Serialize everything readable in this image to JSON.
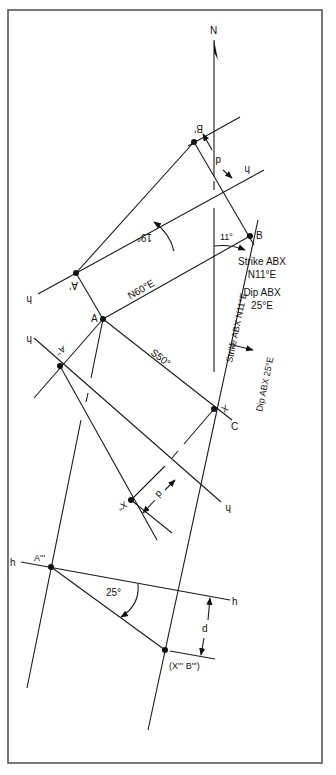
{
  "figure": {
    "north_label": "N",
    "points": {
      "A": "A",
      "B": "B",
      "A_prime": "A'",
      "B_prime": "B'",
      "A_dblprime": "A''",
      "X": "X",
      "X_dblprime": "X''",
      "C": "C",
      "A_tripleprime": "A'''",
      "X_B_tripleprime": "(X''' B''')"
    },
    "fold_lines": {
      "h_upper_left": "h",
      "h_upper_right": "h",
      "h_middle_left": "h",
      "h_middle_right": "h",
      "h_lower_left": "h",
      "h_lower_right": "h"
    },
    "measurements": {
      "d_upper": "d",
      "d_middle": "d",
      "d_lower": "d",
      "angle_19": "19°",
      "angle_11": "11°",
      "angle_25": "25°",
      "bearing_AB": "N60°E",
      "bearing_AC": "S50°"
    },
    "annotations": {
      "strike_along_line": "Strike ABX N11°E",
      "dip_along_line": "Dip ABX 25°E",
      "summary_strike_line1": "Strike ABX",
      "summary_strike_line2": "N11°E",
      "summary_dip_line1": "Dip ABX",
      "summary_dip_line2": "25°E"
    }
  }
}
